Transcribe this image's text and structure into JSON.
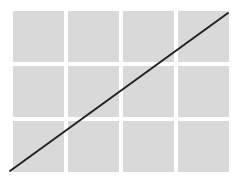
{
  "diagram": {
    "grid": {
      "rows": 3,
      "columns": 4,
      "cell_color": "#d9d9d9",
      "background": "#ffffff"
    },
    "diagonal_line": {
      "x1": 10,
      "y1": 171,
      "x2": 228,
      "y2": 13,
      "color": "#222222",
      "width": 2
    }
  }
}
